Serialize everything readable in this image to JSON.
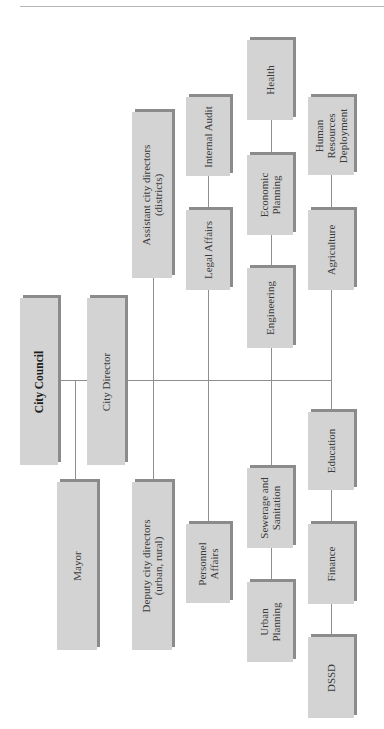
{
  "diagram": {
    "type": "org-chart",
    "orientation": "rotated-90deg-ccw",
    "colors": {
      "box_fill": "#d3d3d3",
      "box_shadow": "#8b8b8b",
      "connector": "#8e8e8e",
      "rule": "#b5b5b5"
    },
    "nodes": {
      "city_council": {
        "label": "City Council",
        "bold": true
      },
      "city_director": {
        "label": "City Director"
      },
      "mayor": {
        "label": "Mayor"
      },
      "assistant_city_directors": {
        "label": "Assistant city directors\n(districts)"
      },
      "deputy_city_directors": {
        "label": "Deputy city directors\n(urban, rural)"
      },
      "internal_audit": {
        "label": "Internal Audit"
      },
      "legal_affairs": {
        "label": "Legal Affairs"
      },
      "personnel_affairs": {
        "label": "Personnel\nAffairs"
      },
      "health": {
        "label": "Health"
      },
      "economic_planning": {
        "label": "Economic\nPlanning"
      },
      "engineering": {
        "label": "Engineering"
      },
      "sewerage_sanitation": {
        "label": "Sewerage and\nSanitation"
      },
      "urban_planning": {
        "label": "Urban\nPlanning"
      },
      "hr_deployment": {
        "label": "Human\nResources\nDeployment"
      },
      "agriculture": {
        "label": "Agriculture"
      },
      "education": {
        "label": "Education"
      },
      "finance": {
        "label": "Finance"
      },
      "dssd": {
        "label": "DSSD"
      }
    },
    "edges": [
      [
        "city_council",
        "city_director"
      ],
      [
        "city_council",
        "mayor"
      ],
      [
        "city_director",
        "assistant_city_directors"
      ],
      [
        "city_director",
        "deputy_city_directors"
      ],
      [
        "city_director",
        "legal_affairs"
      ],
      [
        "legal_affairs",
        "internal_audit"
      ],
      [
        "city_director",
        "personnel_affairs"
      ],
      [
        "city_director",
        "engineering"
      ],
      [
        "engineering",
        "economic_planning"
      ],
      [
        "economic_planning",
        "health"
      ],
      [
        "city_director",
        "sewerage_sanitation"
      ],
      [
        "sewerage_sanitation",
        "urban_planning"
      ],
      [
        "city_director",
        "agriculture"
      ],
      [
        "agriculture",
        "hr_deployment"
      ],
      [
        "city_director",
        "education"
      ],
      [
        "education",
        "finance"
      ],
      [
        "finance",
        "dssd"
      ]
    ]
  }
}
